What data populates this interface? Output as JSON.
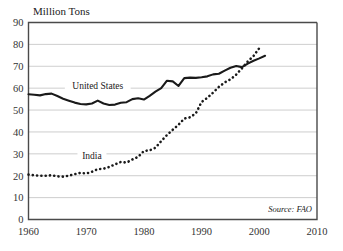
{
  "chart_data": {
    "type": "line",
    "title": "",
    "ylabel": "Million Tons",
    "xlabel": "",
    "xlim": [
      1960,
      2010
    ],
    "ylim": [
      0,
      90
    ],
    "yticks": [
      0,
      10,
      20,
      30,
      40,
      50,
      60,
      70,
      80,
      90
    ],
    "xticks": [
      1960,
      1970,
      1980,
      1990,
      2000,
      2010
    ],
    "grid": true,
    "legend_position": "inline-labels",
    "annotations": [
      "Source: FAO"
    ],
    "source": "Source: FAO",
    "series": [
      {
        "name": "United States",
        "style": "solid",
        "color": "#1a1a1a",
        "label_x": 1972,
        "label_y": 59.5,
        "x": [
          1960,
          1961,
          1962,
          1963,
          1964,
          1965,
          1966,
          1967,
          1968,
          1969,
          1970,
          1971,
          1972,
          1973,
          1974,
          1975,
          1976,
          1977,
          1978,
          1979,
          1980,
          1981,
          1982,
          1983,
          1984,
          1985,
          1986,
          1987,
          1988,
          1989,
          1990,
          1991,
          1992,
          1993,
          1994,
          1995,
          1996,
          1997,
          1998,
          1999,
          2000,
          2001
        ],
        "values": [
          57.2,
          57.0,
          56.7,
          57.3,
          57.5,
          56.4,
          55.2,
          54.3,
          53.4,
          52.8,
          52.6,
          53.0,
          54.3,
          53.0,
          52.3,
          52.5,
          53.3,
          53.6,
          55.0,
          55.4,
          54.8,
          56.5,
          58.4,
          60.0,
          63.4,
          63.1,
          61.0,
          64.6,
          64.8,
          64.7,
          65.0,
          65.4,
          66.3,
          66.6,
          68.0,
          69.3,
          70.1,
          69.6,
          71.2,
          72.5,
          73.6,
          74.8
        ]
      },
      {
        "name": "India",
        "style": "dotted",
        "color": "#1a1a1a",
        "label_x": 1971,
        "label_y": 27.5,
        "x": [
          1960,
          1961,
          1962,
          1963,
          1964,
          1965,
          1966,
          1967,
          1968,
          1969,
          1970,
          1971,
          1972,
          1973,
          1974,
          1975,
          1976,
          1977,
          1978,
          1979,
          1980,
          1981,
          1982,
          1983,
          1984,
          1985,
          1986,
          1987,
          1988,
          1989,
          1990,
          1991,
          1992,
          1993,
          1994,
          1995,
          1996,
          1997,
          1998,
          1999,
          2000
        ],
        "values": [
          20.5,
          20.2,
          20.0,
          20.0,
          20.2,
          19.7,
          19.6,
          20.0,
          20.7,
          21.3,
          21.0,
          21.8,
          23.0,
          23.2,
          24.0,
          25.2,
          26.3,
          26.0,
          27.4,
          28.6,
          31.3,
          31.6,
          32.8,
          35.8,
          38.6,
          41.0,
          43.3,
          46.1,
          46.7,
          48.5,
          53.7,
          55.6,
          58.0,
          60.6,
          62.6,
          64.0,
          66.2,
          69.1,
          72.2,
          74.7,
          78.3
        ]
      }
    ]
  },
  "figure": {
    "axis_title": "Million Tons",
    "source_note": "Source: FAO",
    "us_label": "United States",
    "india_label": "India"
  }
}
